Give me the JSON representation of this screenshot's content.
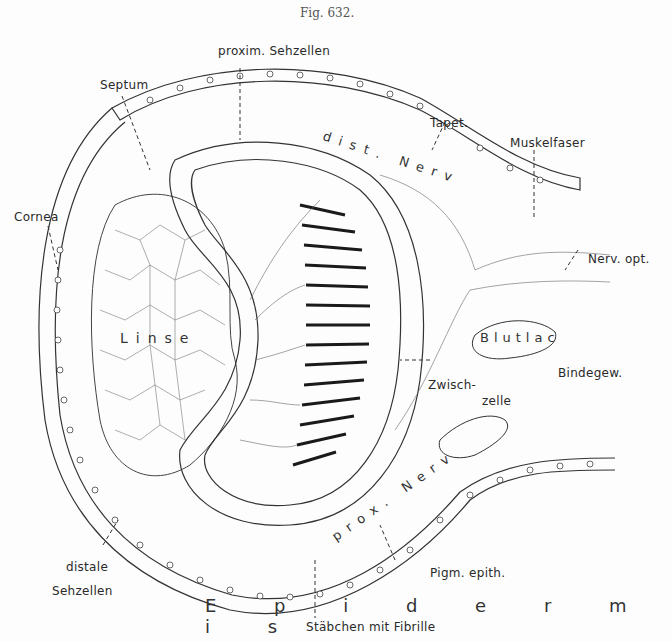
{
  "figure": {
    "number": "Fig. 632."
  },
  "labels": {
    "proxim_sehzellen": "proxim. Sehzellen",
    "septum": "Septum",
    "tapet": "Tapet.",
    "muskelfaser": "Muskelfaser",
    "cornea": "Cornea",
    "nerv_opt": "Nerv. opt.",
    "zwischzelle_1": "Zwisch-",
    "zwischzelle_2": "zelle",
    "bindegew": "Bindegew.",
    "distale_sehzellen_1": "distale",
    "distale_sehzellen_2": "Sehzellen",
    "pigm_epith": "Pigm. epith.",
    "stabchen": "Stäbchen mit Fibrille"
  },
  "inline_labels": {
    "linse": "Linse",
    "blutlac": "Blutlac",
    "dist_nerv": "dist. Nerv",
    "prox_nerv": "prox. Nerv",
    "epidermis": "E p i d e r m i s"
  },
  "colors": {
    "ink": "#2a2a2a",
    "paper": "#fdfdfd",
    "fibre": "#555555"
  }
}
